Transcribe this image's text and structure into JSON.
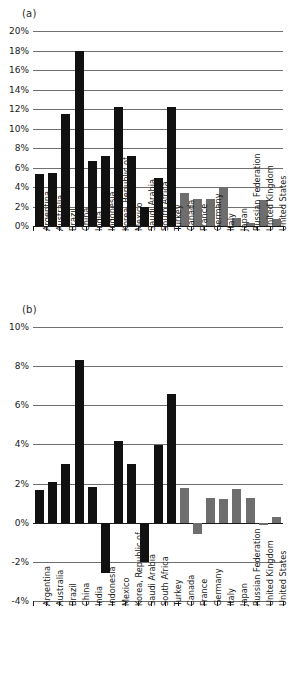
{
  "figure": {
    "panel_a_label": "(a)",
    "panel_b_label": "(b)"
  },
  "categories": [
    "Argentina",
    "Australia",
    "Brazil",
    "China",
    "India",
    "Indonesia",
    "Korea, Republic of",
    "Mexico",
    "Saudi Arabia",
    "South Africa",
    "Turkey",
    "Canada",
    "France",
    "Germany",
    "Italy",
    "Japan",
    "Russian Federation",
    "United Kingdom",
    "United States"
  ],
  "colors": {
    "emerging": "#111111",
    "developed": "#6e6e6e",
    "gridline": "#6f6f6f",
    "axis": "#1a1a1a"
  },
  "chart_data": [
    {
      "type": "bar",
      "title": "(a)",
      "xlabel": "",
      "ylabel": "",
      "ylim": [
        0,
        20
      ],
      "yticks": [
        0,
        2,
        4,
        6,
        8,
        10,
        12,
        14,
        16,
        18,
        20
      ],
      "ytick_labels": [
        "0%",
        "2%",
        "4%",
        "6%",
        "8%",
        "10%",
        "12%",
        "14%",
        "16%",
        "18%",
        "20%"
      ],
      "grid": true,
      "legend": "none",
      "categories": [
        "Argentina",
        "Australia",
        "Brazil",
        "China",
        "India",
        "Indonesia",
        "Korea, Republic of",
        "Mexico",
        "Saudi Arabia",
        "South Africa",
        "Turkey",
        "Canada",
        "France",
        "Germany",
        "Italy",
        "Japan",
        "Russian Federation",
        "United Kingdom",
        "United States"
      ],
      "values": [
        5.3,
        5.4,
        11.5,
        18.0,
        6.7,
        7.2,
        12.2,
        7.2,
        1.95,
        4.95,
        12.2,
        3.4,
        2.75,
        2.75,
        3.95,
        0.85,
        0.3,
        2.65,
        0.7
      ],
      "group": [
        "emerging",
        "emerging",
        "emerging",
        "emerging",
        "emerging",
        "emerging",
        "emerging",
        "emerging",
        "emerging",
        "emerging",
        "emerging",
        "developed",
        "developed",
        "developed",
        "developed",
        "developed",
        "developed",
        "developed",
        "developed"
      ]
    },
    {
      "type": "bar",
      "title": "(b)",
      "xlabel": "",
      "ylabel": "",
      "ylim": [
        -4,
        10
      ],
      "yticks": [
        -4,
        -2,
        0,
        2,
        4,
        6,
        8,
        10
      ],
      "ytick_labels": [
        "-4%",
        "-2%",
        "0%",
        "2%",
        "4%",
        "6%",
        "8%",
        "10%"
      ],
      "grid": true,
      "legend": "none",
      "categories": [
        "Argentina",
        "Australia",
        "Brazil",
        "China",
        "India",
        "Indonesia",
        "Mexico",
        "Korea, Republic of",
        "Saudi Arabia",
        "South Africa",
        "Turkey",
        "Canada",
        "France",
        "Germany",
        "Italy",
        "Japan",
        "Russian Federation",
        "United Kingdom",
        "United States"
      ],
      "values": [
        1.65,
        2.1,
        3.0,
        8.3,
        1.8,
        -2.55,
        4.15,
        3.0,
        -2.0,
        3.95,
        6.6,
        1.75,
        -0.6,
        1.25,
        1.2,
        1.7,
        1.25,
        -0.1,
        0.3
      ],
      "group": [
        "emerging",
        "emerging",
        "emerging",
        "emerging",
        "emerging",
        "emerging",
        "emerging",
        "emerging",
        "emerging",
        "emerging",
        "emerging",
        "developed",
        "developed",
        "developed",
        "developed",
        "developed",
        "developed",
        "developed",
        "developed"
      ]
    }
  ]
}
